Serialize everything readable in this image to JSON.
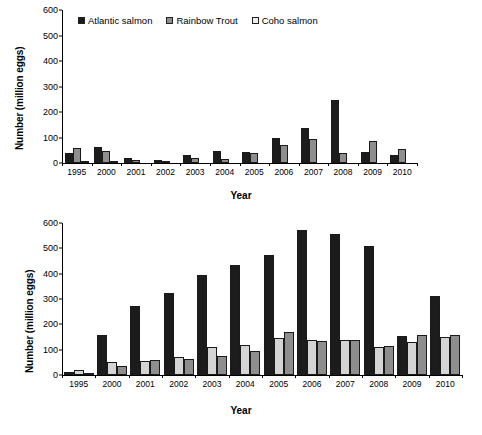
{
  "chart_data": [
    {
      "id": "top",
      "type": "bar",
      "title": "",
      "xlabel": "Year",
      "ylabel": "Number (million eggs)",
      "ylim": [
        0,
        600
      ],
      "ytick_step": 100,
      "yticks": [
        "600",
        "500",
        "400",
        "300",
        "200",
        "100",
        "0"
      ],
      "grid": false,
      "legend_position": "top-left",
      "categories": [
        "1995",
        "2000",
        "2001",
        "2002",
        "2003",
        "2004",
        "2005",
        "2006",
        "2007",
        "2008",
        "2009",
        "2010"
      ],
      "series": [
        {
          "name": "Atlantic salmon",
          "color": "#1c1c1c",
          "values": [
            40,
            62,
            20,
            10,
            30,
            47,
            44,
            98,
            139,
            249,
            45,
            33
          ]
        },
        {
          "name": "Rainbow Trout",
          "color": "#8e8e8e",
          "values": [
            57,
            47,
            12,
            7,
            19,
            14,
            38,
            71,
            93,
            38,
            87,
            55
          ]
        },
        {
          "name": "Coho salmon",
          "color": "#d4d4d4",
          "values": [
            6,
            2,
            0,
            0,
            0,
            0,
            0,
            0,
            0,
            0,
            0,
            0
          ]
        }
      ]
    },
    {
      "id": "bottom",
      "type": "bar",
      "title": "",
      "xlabel": "Year",
      "ylabel": "Number (million eggs)",
      "ylim": [
        0,
        600
      ],
      "ytick_step": 100,
      "yticks": [
        "600",
        "500",
        "400",
        "300",
        "200",
        "100",
        "0"
      ],
      "grid": false,
      "legend_position": "none",
      "categories": [
        "1995",
        "2000",
        "2001",
        "2002",
        "2003",
        "2004",
        "2005",
        "2006",
        "2007",
        "2008",
        "2009",
        "2010"
      ],
      "series": [
        {
          "name": "Atlantic salmon",
          "color": "#1c1c1c",
          "values": [
            13,
            158,
            274,
            324,
            395,
            433,
            472,
            574,
            555,
            509,
            155,
            313
          ]
        },
        {
          "name": "Coho salmon",
          "color": "#d4d4d4",
          "values": [
            21,
            50,
            55,
            70,
            111,
            117,
            145,
            138,
            137,
            110,
            130,
            152
          ]
        },
        {
          "name": "Rainbow Trout",
          "color": "#8e8e8e",
          "values": [
            6,
            35,
            60,
            64,
            75,
            94,
            169,
            136,
            138,
            114,
            158,
            157
          ]
        }
      ]
    }
  ],
  "legend": {
    "items": [
      {
        "label": "Atlantic salmon"
      },
      {
        "label": "Rainbow Trout"
      },
      {
        "label": "Coho salmon"
      }
    ]
  }
}
